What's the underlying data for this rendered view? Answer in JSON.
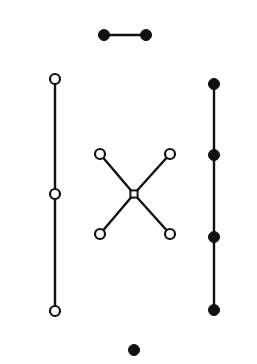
{
  "figure": {
    "title": "",
    "background_color": "#ffffff",
    "stroke_color": "#111111",
    "fill_color": "#111111",
    "open_fill_color": "#ffffff",
    "width": 257,
    "height": 364
  },
  "chart_data": {
    "type": "scatter",
    "title": "",
    "xlabel": "",
    "ylabel": "",
    "xlim": [
      0,
      257
    ],
    "ylim": [
      0,
      364
    ],
    "grid": false,
    "legend": null,
    "groups": [
      {
        "name": "top-dumbbell",
        "node_style": "filled",
        "nodes": [
          {
            "id": "d1",
            "x": 104,
            "y": 35,
            "r": 5.5,
            "style": "filled"
          },
          {
            "id": "d2",
            "x": 146,
            "y": 35,
            "r": 5.5,
            "style": "filled"
          }
        ],
        "edges": [
          {
            "from": "d1",
            "to": "d2"
          }
        ]
      },
      {
        "name": "left-chain",
        "node_style": "open",
        "nodes": [
          {
            "id": "l1",
            "x": 55,
            "y": 79,
            "r": 5.0,
            "style": "open"
          },
          {
            "id": "l2",
            "x": 55,
            "y": 194,
            "r": 5.0,
            "style": "open"
          },
          {
            "id": "l3",
            "x": 55,
            "y": 311,
            "r": 5.0,
            "style": "open"
          }
        ],
        "edges": [
          {
            "from": "l1",
            "to": "l2"
          },
          {
            "from": "l2",
            "to": "l3"
          }
        ]
      },
      {
        "name": "center-x",
        "node_style": "open",
        "nodes": [
          {
            "id": "c0",
            "x": 134,
            "y": 194,
            "r": 3.6,
            "style": "open-square"
          },
          {
            "id": "c1",
            "x": 100,
            "y": 154,
            "r": 5.0,
            "style": "open"
          },
          {
            "id": "c2",
            "x": 170,
            "y": 154,
            "r": 5.0,
            "style": "open"
          },
          {
            "id": "c3",
            "x": 100,
            "y": 234,
            "r": 5.0,
            "style": "open"
          },
          {
            "id": "c4",
            "x": 170,
            "y": 234,
            "r": 5.0,
            "style": "open"
          }
        ],
        "edges": [
          {
            "from": "c0",
            "to": "c1"
          },
          {
            "from": "c0",
            "to": "c2"
          },
          {
            "from": "c0",
            "to": "c3"
          },
          {
            "from": "c0",
            "to": "c4"
          }
        ]
      },
      {
        "name": "right-chain",
        "node_style": "filled",
        "nodes": [
          {
            "id": "r1",
            "x": 214,
            "y": 84,
            "r": 5.5,
            "style": "filled"
          },
          {
            "id": "r2",
            "x": 214,
            "y": 155,
            "r": 5.5,
            "style": "filled"
          },
          {
            "id": "r3",
            "x": 214,
            "y": 237,
            "r": 5.5,
            "style": "filled"
          },
          {
            "id": "r4",
            "x": 214,
            "y": 310,
            "r": 5.5,
            "style": "filled"
          }
        ],
        "edges": [
          {
            "from": "r1",
            "to": "r2"
          },
          {
            "from": "r2",
            "to": "r3"
          },
          {
            "from": "r3",
            "to": "r4"
          }
        ]
      },
      {
        "name": "bottom-isolated-node",
        "node_style": "filled",
        "nodes": [
          {
            "id": "b1",
            "x": 134,
            "y": 350,
            "r": 5.5,
            "style": "filled"
          }
        ],
        "edges": []
      }
    ]
  }
}
